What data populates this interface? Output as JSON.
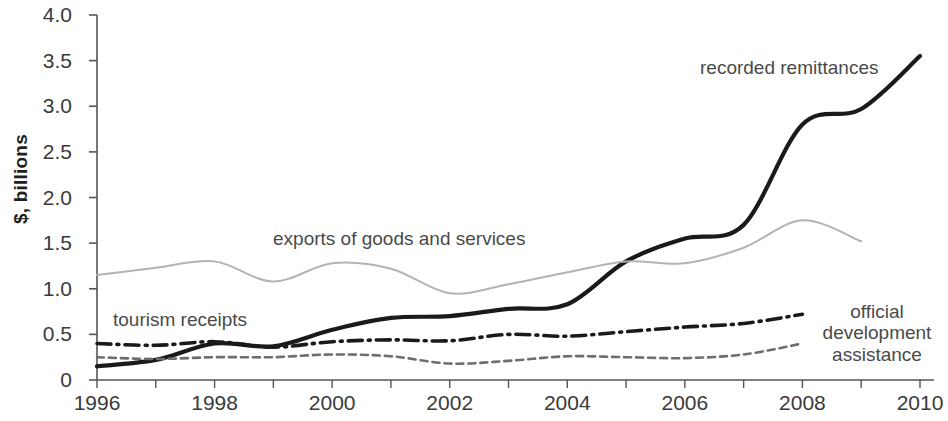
{
  "axis": {
    "y_title": "$, billions",
    "y_ticks": [
      "4.0",
      "3.5",
      "3.0",
      "2.5",
      "2.0",
      "1.5",
      "1.0",
      "0.5",
      "0"
    ],
    "x_ticks": [
      "1996",
      "1998",
      "2000",
      "2002",
      "2004",
      "2006",
      "2008",
      "2010"
    ]
  },
  "annotations": {
    "remittances": "recorded remittances",
    "exports": "exports of goods and services",
    "tourism": "tourism receipts",
    "oda_line1": "official",
    "oda_line2": "development",
    "oda_line3": "assistance"
  },
  "colors": {
    "remittances": "#1a1a1a",
    "exports": "#b3b3b3",
    "tourism": "#6e6e6e",
    "oda": "#1a1a1a",
    "axis": "#555555",
    "text": "#3a3a3a"
  },
  "chart_data": {
    "type": "line",
    "title": "",
    "xlabel": "",
    "ylabel": "$, billions",
    "xlim": [
      1996,
      2010
    ],
    "ylim": [
      0,
      4.0
    ],
    "ytick_values": [
      0,
      0.5,
      1.0,
      1.5,
      2.0,
      2.5,
      3.0,
      3.5,
      4.0
    ],
    "xtick_values": [
      1996,
      1998,
      2000,
      2002,
      2004,
      2006,
      2008,
      2010
    ],
    "grid": false,
    "legend": "inline-annotations",
    "x": [
      1996,
      1997,
      1998,
      1999,
      2000,
      2001,
      2002,
      2003,
      2004,
      2005,
      2006,
      2007,
      2008,
      2009,
      2010
    ],
    "series": [
      {
        "name": "recorded remittances",
        "style": "solid-thick",
        "color": "#1a1a1a",
        "values": [
          0.15,
          0.22,
          0.4,
          0.37,
          0.55,
          0.68,
          0.7,
          0.78,
          0.83,
          1.3,
          1.55,
          1.7,
          2.8,
          2.97,
          3.55
        ]
      },
      {
        "name": "exports of goods and services",
        "style": "solid-thin-light",
        "color": "#b3b3b3",
        "values": [
          1.15,
          1.23,
          1.3,
          1.08,
          1.28,
          1.22,
          0.95,
          1.05,
          1.18,
          1.3,
          1.28,
          1.45,
          1.75,
          1.52,
          null
        ]
      },
      {
        "name": "official development assistance",
        "style": "dash-dot",
        "color": "#1a1a1a",
        "values": [
          0.4,
          0.38,
          0.42,
          0.36,
          0.42,
          0.44,
          0.43,
          0.5,
          0.48,
          0.53,
          0.58,
          0.62,
          0.72,
          null,
          null
        ]
      },
      {
        "name": "tourism receipts",
        "style": "dashed",
        "color": "#6e6e6e",
        "values": [
          0.25,
          0.23,
          0.25,
          0.25,
          0.28,
          0.26,
          0.18,
          0.21,
          0.26,
          0.25,
          0.24,
          0.28,
          0.4,
          null,
          null
        ]
      }
    ]
  }
}
